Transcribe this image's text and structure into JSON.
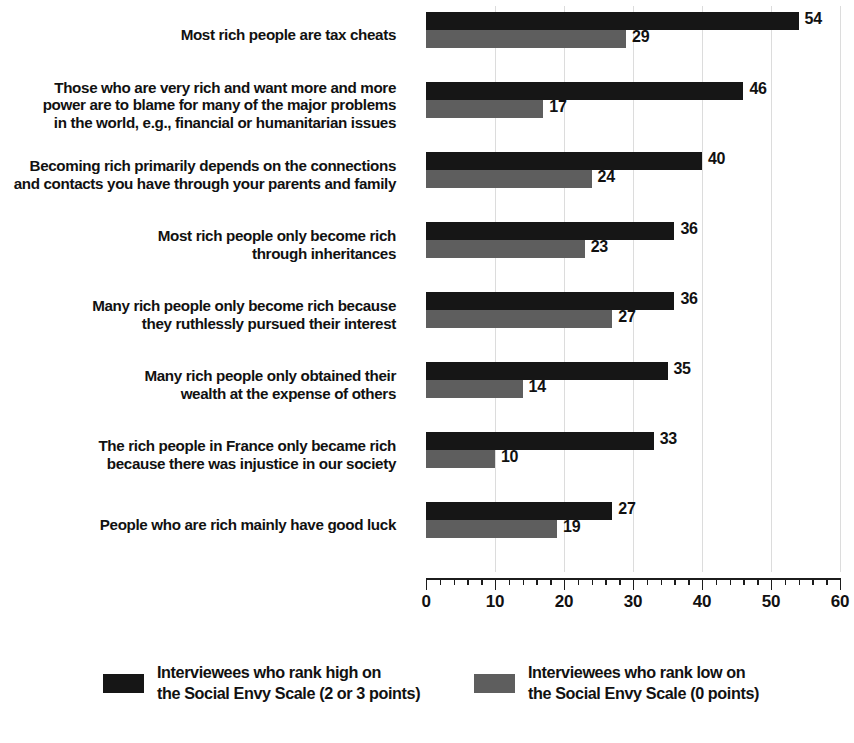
{
  "chart_data": {
    "type": "bar",
    "orientation": "horizontal",
    "title": "",
    "subtitle": "",
    "xlabel": "",
    "ylabel": "",
    "xlim": [
      0,
      60
    ],
    "xticks": [
      0,
      10,
      20,
      30,
      40,
      50,
      60
    ],
    "xtick_labels": [
      "0",
      "10",
      "20",
      "30",
      "40",
      "50",
      "60"
    ],
    "minor_tick_step": 2,
    "grid": "vertical-light",
    "legend_position": "bottom",
    "categories": [
      "Most rich people are tax cheats",
      "Those who are very rich and want more and more power are to blame for many of the major problems in the world, e.g., financial or humanitarian issues",
      "Becoming rich primarily depends on the connections and contacts you have through your parents and family",
      "Most rich people only become rich through inheritances",
      "Many rich people only become rich because they ruthlessly pursued their interest",
      "Many rich people only obtained their wealth at the expense of others",
      "The rich people in France only became rich because there was injustice in our society",
      "People who are rich mainly have good luck"
    ],
    "category_lines": [
      [
        "Most rich people are tax cheats"
      ],
      [
        "Those who are very rich and want more and more",
        "power are to blame for many of the major problems",
        "in the world, e.g., financial or humanitarian issues"
      ],
      [
        "Becoming rich primarily depends on the connections",
        "and contacts you have through your parents and family"
      ],
      [
        "Most rich people only become rich",
        "through inheritances"
      ],
      [
        "Many rich people only become rich because",
        "they ruthlessly pursued their interest"
      ],
      [
        "Many rich people only obtained their",
        "wealth at the expense of others"
      ],
      [
        "The rich people in France only became rich",
        "because there was injustice in our society"
      ],
      [
        "People who are rich mainly have good luck"
      ]
    ],
    "series": [
      {
        "name": "Interviewees who rank high on the Social Envy Scale (2 or 3 points)",
        "color": "#161616",
        "values": [
          54,
          46,
          40,
          36,
          36,
          35,
          33,
          27
        ]
      },
      {
        "name": "Interviewees who rank low on the Social Envy Scale (0 points)",
        "color": "#5E5E5E",
        "values": [
          29,
          17,
          24,
          23,
          27,
          14,
          10,
          19
        ]
      }
    ]
  },
  "legend": {
    "entries": [
      {
        "label": "Interviewees who rank high on\nthe Social Envy Scale (2 or 3 points)",
        "color": "#161616"
      },
      {
        "label": "Interviewees who rank low on\nthe Social Envy Scale (0 points)",
        "color": "#5E5E5E"
      }
    ]
  }
}
